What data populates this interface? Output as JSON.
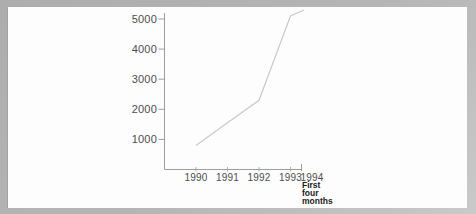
{
  "page": {
    "background_color": "#b3b3b3",
    "paper_color": "#fdfdfd"
  },
  "chart_data": {
    "type": "line",
    "title": "",
    "xlabel": "",
    "ylabel": "",
    "categories": [
      "1990",
      "1991",
      "1992",
      "1993",
      "1994"
    ],
    "values": [
      800,
      1550,
      2300,
      5100,
      5300
    ],
    "y_ticks": [
      1000,
      2000,
      3000,
      4000,
      5000
    ],
    "ylim": [
      0,
      5200
    ],
    "grid": false,
    "legend": "none",
    "x_note_lines": [
      "First",
      "four",
      "months"
    ],
    "x_note_applies_to": "1994",
    "line_color": "#c7cacc",
    "axis_color": "#9e9e9e",
    "tick_label_color": "#4d4d4d",
    "note_color": "#1a1a1a"
  }
}
